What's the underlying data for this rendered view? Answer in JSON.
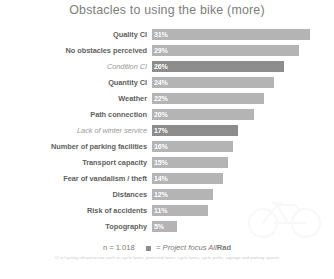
{
  "chart_data": {
    "type": "bar",
    "title": "Obstacles to using the bike (more)",
    "xlabel": "",
    "ylabel": "",
    "orientation": "horizontal",
    "grid": false,
    "xlim": [
      0,
      35
    ],
    "legend_position": "bottom-center",
    "categories": [
      "Quality CI",
      "No obstacles perceived",
      "Condition CI",
      "Quantity CI",
      "Weather",
      "Path connection",
      "Lack of winter service",
      "Number of parking facilities",
      "Transport capacity",
      "Fear of vandalism / theft",
      "Distances",
      "Risk of accidents",
      "Topography"
    ],
    "values": [
      31,
      29,
      26,
      24,
      22,
      20,
      17,
      16,
      15,
      14,
      12,
      11,
      5
    ],
    "value_labels": [
      "31%",
      "29%",
      "26%",
      "24%",
      "22%",
      "20%",
      "17%",
      "16%",
      "15%",
      "14%",
      "12%",
      "11%",
      "5%"
    ],
    "focus_flags": [
      false,
      false,
      true,
      false,
      false,
      false,
      true,
      false,
      false,
      false,
      false,
      false,
      false
    ],
    "series": [
      {
        "name": "Obstacles",
        "values": [
          31,
          29,
          26,
          24,
          22,
          20,
          17,
          16,
          15,
          14,
          12,
          11,
          5
        ]
      }
    ],
    "colors": {
      "bar": "#b4b4b4",
      "bar_focus": "#8d8d8d",
      "value_label": "#ffffff",
      "title": "#7d7d7d",
      "background": "#ffffff"
    }
  },
  "footer": {
    "sample_size": "n = 1.018",
    "legend_label_prefix": "= Project focus All",
    "legend_label_bold": "Rad",
    "footnote": "CI = Cycling infrastructure such as cycle lanes, protected lanes, cycle lanes, cycle paths, signage and parking spaces"
  }
}
